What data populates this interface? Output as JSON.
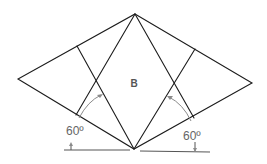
{
  "diagram": {
    "center_label": "B",
    "angle_left": "60º",
    "angle_right": "60º",
    "colors": {
      "line": "#1c1c1c",
      "annotation": "#8a8a8a",
      "label": "#666666",
      "background": "#ffffff"
    }
  }
}
